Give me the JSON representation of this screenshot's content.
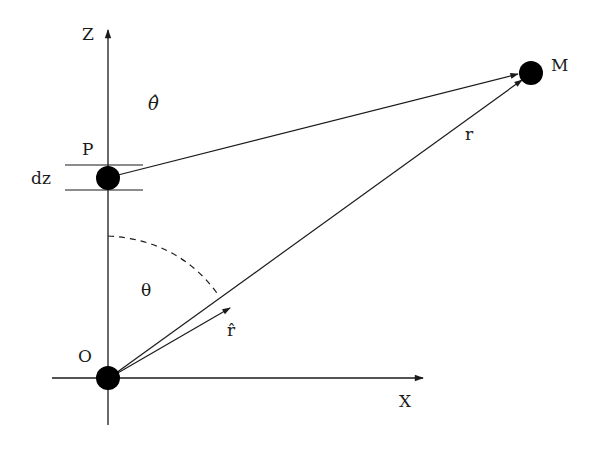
{
  "diagram": {
    "type": "geometry-vector-diagram",
    "labels": {
      "z_axis": "Z",
      "x_axis": "X",
      "origin": "O",
      "point_p": "P",
      "point_m": "M",
      "element": "dz",
      "theta_hat": "θ̂",
      "theta": "θ",
      "r_hat": "r̂",
      "r": "r"
    },
    "colors": {
      "ink": "#1a1a1a",
      "background": "#ffffff"
    },
    "points": {
      "O": [
        108,
        378
      ],
      "P": [
        108,
        178
      ],
      "M": [
        531,
        73
      ]
    }
  }
}
